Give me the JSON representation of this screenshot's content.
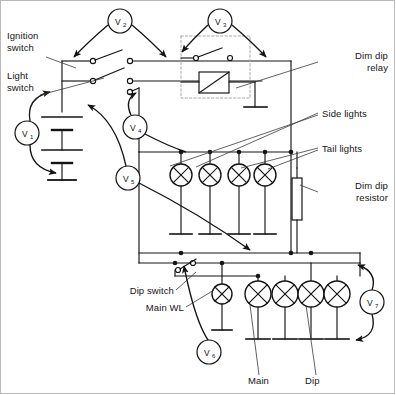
{
  "diagram": {
    "stroke_color": "#141414",
    "frame_color": "#b9b9b9",
    "relay_box_color": "#a8a8a8",
    "leader_color": "#3a3a3a",
    "labels": {
      "ignition_switch": "Ignition\nswitch",
      "light_switch": "Light\nswitch",
      "dim_dip_relay": "Dim dip\nrelay",
      "side_lights": "Side lights",
      "tail_lights": "Tail lights",
      "dim_dip_resistor": "Dim dip\nresistor",
      "dip_switch": "Dip switch",
      "main_wl": "Main WL",
      "main": "Main",
      "dip": "Dip"
    },
    "meters": [
      {
        "id": "v1",
        "letter": "V",
        "sub": "1",
        "cx": 27,
        "cy": 133,
        "r": 12
      },
      {
        "id": "v2",
        "letter": "V",
        "sub": "2",
        "cx": 120,
        "cy": 21,
        "r": 12
      },
      {
        "id": "v3",
        "letter": "V",
        "sub": "3",
        "cx": 220,
        "cy": 21,
        "r": 12
      },
      {
        "id": "v4",
        "letter": "V",
        "sub": "4",
        "cx": 135,
        "cy": 127,
        "r": 12
      },
      {
        "id": "v5",
        "letter": "V",
        "sub": "5",
        "cx": 128,
        "cy": 178,
        "r": 12
      },
      {
        "id": "v6",
        "letter": "V",
        "sub": "6",
        "cx": 209,
        "cy": 352,
        "r": 12
      },
      {
        "id": "v7",
        "letter": "V",
        "sub": "7",
        "cx": 372,
        "cy": 302,
        "r": 12
      }
    ],
    "lamps_upper": [
      {
        "id": "side-lamp-1",
        "cx": 181,
        "cy": 175,
        "r": 11
      },
      {
        "id": "side-lamp-2",
        "cx": 210,
        "cy": 175,
        "r": 11
      },
      {
        "id": "tail-lamp-1",
        "cx": 239,
        "cy": 175,
        "r": 11
      },
      {
        "id": "tail-lamp-2",
        "cx": 265,
        "cy": 175,
        "r": 11
      }
    ],
    "lamps_lower": [
      {
        "id": "main-wl-lamp",
        "cx": 222,
        "cy": 294,
        "r": 10
      },
      {
        "id": "main-lamp-1",
        "cx": 258,
        "cy": 294,
        "r": 13
      },
      {
        "id": "main-lamp-2",
        "cx": 285,
        "cy": 294,
        "r": 13
      },
      {
        "id": "dip-lamp-1",
        "cx": 311,
        "cy": 294,
        "r": 13
      },
      {
        "id": "dip-lamp-2",
        "cx": 337,
        "cy": 294,
        "r": 13
      }
    ],
    "components": {
      "battery_cells": 2,
      "relay_coil": "rectangle-with-diagonal",
      "resistor": "vertical-bar"
    }
  }
}
